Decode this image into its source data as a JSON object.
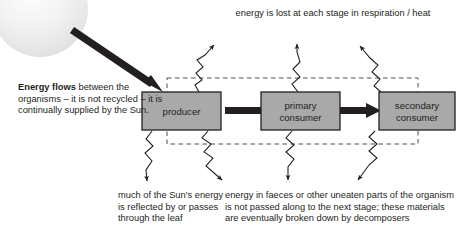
{
  "diagram": {
    "title_implied": "Energy flow through a food chain",
    "captions": {
      "top": "energy is lost at each stage in respiration / heat",
      "left_lead": "Energy flows",
      "left_rest": " between the organisms – it is not recycled – it is continually supplied by the Sun.",
      "bottom_left": "much of the Sun's energy is reflected by or passes through the leaf",
      "bottom_right": "energy in faeces or other uneaten parts of the organism is not passed along to the next stage; these materials are eventually broken down by decomposers"
    },
    "boxes": [
      {
        "id": "producer",
        "line1": "producer",
        "line2": ""
      },
      {
        "id": "primary-consumer",
        "line1": "primary",
        "line2": "consumer"
      },
      {
        "id": "secondary-consumer",
        "line1": "secondary",
        "line2": "consumer"
      }
    ],
    "colors": {
      "box_fill": "#a9a9a9",
      "box_stroke": "#231f20",
      "arrow": "#231f20",
      "dashed_boundary": "#4d4d4d",
      "sun": "#ebebeb",
      "text": "#231f20",
      "background": "#ffffff"
    },
    "icons": {
      "sun": "sun-icon",
      "sun_arrow": "thick-diagonal-arrow-icon",
      "flow_arrow": "thick-right-arrow-icon",
      "loss_arrow": "zigzag-arrow-icon",
      "boundary": "dashed-boundary-icon"
    }
  }
}
